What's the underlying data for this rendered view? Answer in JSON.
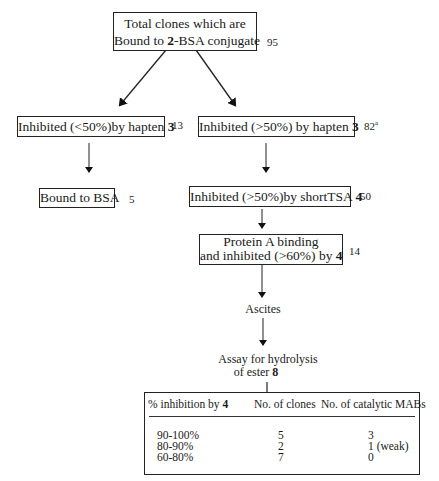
{
  "flowchart": {
    "root": {
      "line1": "Total clones which are",
      "line2_pre": "Bound to ",
      "line2_bold": "2",
      "line2_post": "-BSA conjugate",
      "count": "95"
    },
    "left_branch": {
      "text_pre": "Inhibited (<50%)by hapten ",
      "text_bold": "3",
      "count": "13"
    },
    "left_leaf": {
      "text": "Bound to BSA",
      "count": "5"
    },
    "right_branch": {
      "text_pre": "Inhibited (>50%) by hapten ",
      "text_bold": "3",
      "count": "82",
      "count_sup": "a"
    },
    "short_tsa": {
      "text_pre": "Inhibited (>50%)by shortTSA ",
      "text_bold": "4",
      "count": "50"
    },
    "protein_a": {
      "line1": "Protein A binding",
      "line2_pre": "and inhibited (>60%) by ",
      "line2_bold": "4",
      "count": "14"
    },
    "ascites": {
      "text": "Ascites"
    },
    "assay": {
      "line1": "Assay for hydrolysis",
      "line2_pre": "of ester ",
      "line2_bold": "8"
    }
  },
  "table": {
    "headers": {
      "col1_pre": "% inhibition by ",
      "col1_bold": "4",
      "col2": "No. of clones",
      "col3": "No. of catalytic MABs"
    },
    "rows": [
      {
        "range": "90-100%",
        "clones": "5",
        "catalytic": "3"
      },
      {
        "range": "80-90%",
        "clones": "2",
        "catalytic": "1 (weak)"
      },
      {
        "range": "60-80%",
        "clones": "7",
        "catalytic": "0"
      }
    ]
  },
  "colors": {
    "line": "#222222",
    "text": "#1a1a1a",
    "background": "#ffffff"
  }
}
